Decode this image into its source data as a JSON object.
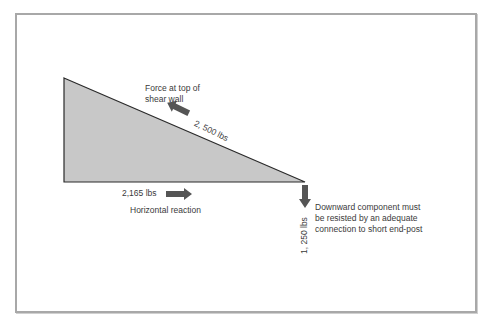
{
  "diagram": {
    "colors": {
      "frame_border": "#a8a8a8",
      "triangle_fill": "#c8c8c8",
      "triangle_stroke": "#2a2a2a",
      "arrow_fill": "#555555",
      "text": "#3a3a3a"
    },
    "labels": {
      "top_force_line1": "Force at top of",
      "top_force_line2": "shear wall",
      "top_force_value": "2, 500 lbs",
      "horizontal_value": "2,165 lbs",
      "horizontal_label": "Horizontal reaction",
      "downward_value": "1, 250 lbs",
      "downward_line1": "Downward component must",
      "downward_line2": "be resisted by an adequate",
      "downward_line3": "connection to short end-post"
    }
  }
}
